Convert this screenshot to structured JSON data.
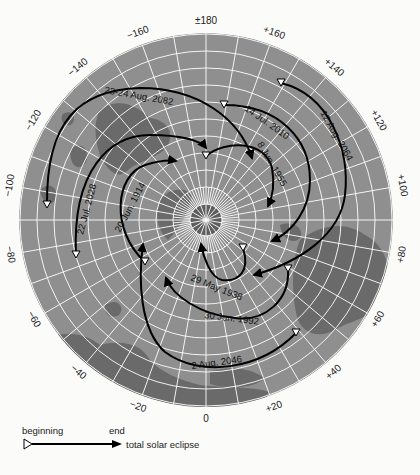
{
  "map": {
    "projection": "polar (north pole centered)",
    "center": [
      206,
      220
    ],
    "radius": 187,
    "colors": {
      "ocean": "#8f8f8f",
      "land": "#6a6a6a",
      "grid": "#ffffff",
      "pole_disc": "#5e5e5e",
      "path": "#000000"
    },
    "longitude_labels": [
      {
        "text": "±180",
        "angle": 0
      },
      {
        "text": "+160",
        "angle": 20
      },
      {
        "text": "+140",
        "angle": 40
      },
      {
        "text": "+120",
        "angle": 60
      },
      {
        "text": "+100",
        "angle": 80
      },
      {
        "text": "+80",
        "angle": 100
      },
      {
        "text": "+60",
        "angle": 120
      },
      {
        "text": "+40",
        "angle": 140
      },
      {
        "text": "+20",
        "angle": 160
      },
      {
        "text": "0",
        "angle": 180
      },
      {
        "text": "−20",
        "angle": 200
      },
      {
        "text": "−40",
        "angle": 220
      },
      {
        "text": "−60",
        "angle": 240
      },
      {
        "text": "−80",
        "angle": 260
      },
      {
        "text": "−100",
        "angle": 280
      },
      {
        "text": "−120",
        "angle": 300
      },
      {
        "text": "−140",
        "angle": 320
      },
      {
        "text": "−160",
        "angle": 340
      }
    ],
    "eclipse_paths": [
      {
        "label": "23-24 Aug. 2082",
        "start": [
          47,
          205
        ],
        "end": [
          252,
          158
        ]
      },
      {
        "label": "22 Jul. 2028",
        "start": [
          76,
          255
        ],
        "end": [
          206,
          148
        ]
      },
      {
        "label": "20 Jun. 1914",
        "start": [
          145,
          262
        ],
        "end": [
          176,
          161
        ]
      },
      {
        "label": "8 Jun. 1955",
        "start": [
          206,
          156
        ],
        "end": [
          268,
          206
        ]
      },
      {
        "label": "14 Jul. 2010",
        "start": [
          224,
          105
        ],
        "end": [
          272,
          241
        ]
      },
      {
        "label": "12 Aug. 2064",
        "start": [
          281,
          83
        ],
        "end": [
          254,
          275
        ]
      },
      {
        "label": "29 May 1938",
        "start": [
          243,
          248
        ],
        "end": [
          201,
          244
        ]
      },
      {
        "label": "30 Jun. 1992",
        "start": [
          288,
          269
        ],
        "end": [
          166,
          278
        ]
      },
      {
        "label": "2 Aug. 2046",
        "start": [
          296,
          333
        ],
        "end": [
          143,
          244
        ]
      }
    ]
  },
  "legend": {
    "beginning_label": "beginning",
    "end_label": "end",
    "description": "total solar eclipse"
  }
}
